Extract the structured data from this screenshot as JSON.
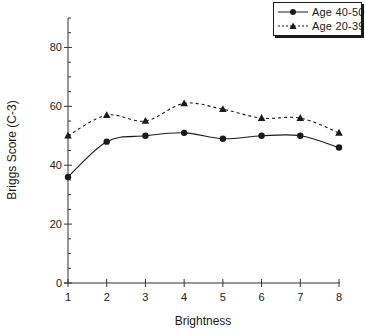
{
  "chart_data": {
    "type": "line",
    "title": "",
    "xlabel": "Brightness",
    "ylabel": "Briggs Score (C-3)",
    "x": [
      1,
      2,
      3,
      4,
      5,
      6,
      7,
      8
    ],
    "xticks": [
      "1",
      "2",
      "3",
      "4",
      "5",
      "6",
      "7",
      "8"
    ],
    "yticks": [
      "0",
      "20",
      "40",
      "60",
      "80"
    ],
    "ylim": [
      0,
      90
    ],
    "xlim": [
      1,
      8
    ],
    "grid": false,
    "legend_position": "top-right",
    "series": [
      {
        "name": "Age 40-50",
        "marker": "circle",
        "line": "solid",
        "color": "#1a1a1a",
        "values": [
          36,
          48,
          50,
          51,
          49,
          50,
          50,
          46
        ]
      },
      {
        "name": "Age 20-39",
        "marker": "triangle",
        "line": "dashed",
        "color": "#1a1a1a",
        "values": [
          50,
          57,
          55,
          61,
          59,
          56,
          56,
          51
        ]
      }
    ]
  },
  "legend": {
    "items": [
      {
        "label": "Age  40-50"
      },
      {
        "label": "Age  20-39"
      }
    ]
  }
}
